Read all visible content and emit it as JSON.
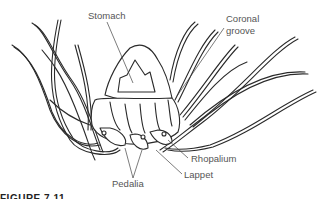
{
  "figure": {
    "labels": {
      "stomach": "Stomach",
      "coronal_groove": "Coronal\ngroove",
      "coronal_groove_line1": "Coronal",
      "coronal_groove_line2": "groove",
      "rhopalium": "Rhopalium",
      "lappet": "Lappet",
      "pedalia": "Pedalia"
    },
    "caption": "FIGURE 7.11"
  }
}
